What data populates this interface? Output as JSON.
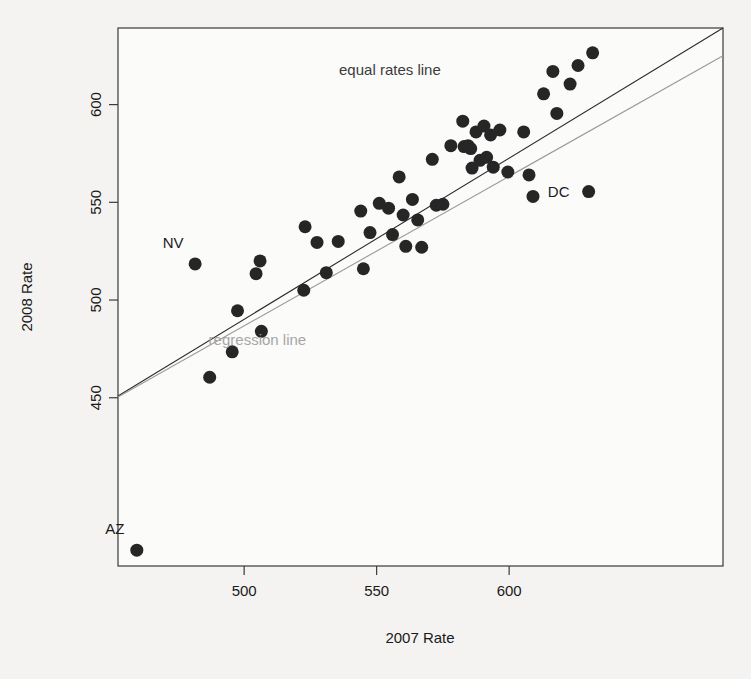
{
  "chart_data": {
    "type": "scatter",
    "title": "",
    "xlabel": "2007 Rate",
    "ylabel": "2008 Rate",
    "xlim": [
      452.4,
      680.7
    ],
    "ylim": [
      363.9,
      639.2
    ],
    "xticks": [
      500,
      550,
      600
    ],
    "yticks": [
      450,
      500,
      550,
      600
    ],
    "xtick_labels": [
      "500",
      "550",
      "600"
    ],
    "ytick_labels": [
      "450",
      "500",
      "550",
      "600"
    ],
    "grid": false,
    "legend": "none",
    "point_color": "#262626",
    "point_radius": 6.5,
    "annotations": [
      {
        "text": "equal rates line",
        "x": 555,
        "y": 615,
        "color": "#3c3c3c"
      },
      {
        "text": "regression line",
        "x": 505,
        "y": 477,
        "color": "#a6a6a6"
      }
    ],
    "lines": [
      {
        "name": "equal rates line",
        "color": "#2b2b2b",
        "width": 1.1,
        "x0": 452.4,
        "y0": 450.9,
        "x1": 680.7,
        "y1": 639.2
      },
      {
        "name": "regression line",
        "color": "#9a9a9a",
        "width": 1.1,
        "x0": 452.4,
        "y0": 450.4,
        "x1": 680.7,
        "y1": 625.0
      }
    ],
    "point_labels": [
      {
        "label": "NV",
        "x": 481.5,
        "y": 518.5,
        "dx": -22,
        "dy": -16
      },
      {
        "label": "AZ",
        "x": 459.5,
        "y": 372.0,
        "dx": -22,
        "dy": -16
      },
      {
        "label": "DC",
        "x": 630.0,
        "y": 555.5,
        "dx": -30,
        "dy": 5
      }
    ],
    "points": [
      {
        "x": 459.5,
        "y": 372.0
      },
      {
        "x": 481.5,
        "y": 518.5
      },
      {
        "x": 487.0,
        "y": 460.5
      },
      {
        "x": 495.5,
        "y": 473.5
      },
      {
        "x": 497.5,
        "y": 494.5
      },
      {
        "x": 504.5,
        "y": 513.5
      },
      {
        "x": 506.0,
        "y": 520.0
      },
      {
        "x": 506.5,
        "y": 484.0
      },
      {
        "x": 522.5,
        "y": 505.0
      },
      {
        "x": 523.0,
        "y": 537.5
      },
      {
        "x": 527.5,
        "y": 529.5
      },
      {
        "x": 531.0,
        "y": 514.0
      },
      {
        "x": 535.5,
        "y": 530.0
      },
      {
        "x": 544.0,
        "y": 545.5
      },
      {
        "x": 545.0,
        "y": 516.0
      },
      {
        "x": 547.5,
        "y": 534.5
      },
      {
        "x": 551.0,
        "y": 549.5
      },
      {
        "x": 554.5,
        "y": 547.0
      },
      {
        "x": 556.0,
        "y": 533.5
      },
      {
        "x": 558.5,
        "y": 563.0
      },
      {
        "x": 560.0,
        "y": 543.5
      },
      {
        "x": 561.0,
        "y": 527.5
      },
      {
        "x": 563.5,
        "y": 551.5
      },
      {
        "x": 565.5,
        "y": 541.0
      },
      {
        "x": 567.0,
        "y": 527.0
      },
      {
        "x": 571.0,
        "y": 572.0
      },
      {
        "x": 572.5,
        "y": 548.5
      },
      {
        "x": 575.0,
        "y": 549.0
      },
      {
        "x": 578.0,
        "y": 579.0
      },
      {
        "x": 582.5,
        "y": 591.5
      },
      {
        "x": 583.0,
        "y": 578.5
      },
      {
        "x": 584.5,
        "y": 579.0
      },
      {
        "x": 585.5,
        "y": 577.5
      },
      {
        "x": 586.0,
        "y": 567.5
      },
      {
        "x": 587.5,
        "y": 586.0
      },
      {
        "x": 589.0,
        "y": 571.5
      },
      {
        "x": 590.5,
        "y": 589.0
      },
      {
        "x": 591.5,
        "y": 573.0
      },
      {
        "x": 593.0,
        "y": 584.5
      },
      {
        "x": 594.0,
        "y": 568.0
      },
      {
        "x": 596.5,
        "y": 587.0
      },
      {
        "x": 599.5,
        "y": 565.5
      },
      {
        "x": 605.5,
        "y": 586.0
      },
      {
        "x": 607.5,
        "y": 564.0
      },
      {
        "x": 609.0,
        "y": 553.0
      },
      {
        "x": 613.0,
        "y": 605.5
      },
      {
        "x": 616.5,
        "y": 617.0
      },
      {
        "x": 618.0,
        "y": 595.5
      },
      {
        "x": 623.0,
        "y": 610.5
      },
      {
        "x": 626.0,
        "y": 620.0
      },
      {
        "x": 630.0,
        "y": 555.5
      },
      {
        "x": 631.5,
        "y": 626.5
      }
    ]
  }
}
